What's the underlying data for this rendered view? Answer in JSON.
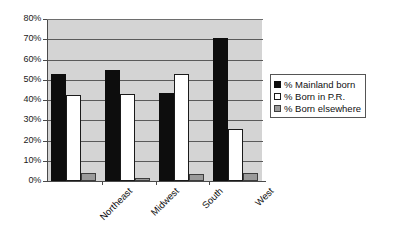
{
  "chart_data": {
    "type": "bar",
    "title": "",
    "subtitle": "",
    "xlabel": "",
    "ylabel": "",
    "categories": [
      "Northeast",
      "Midwest",
      "South",
      "West"
    ],
    "series": [
      {
        "name": "% Mainland born",
        "color": "#0d0d0d",
        "values": [
          53,
          55,
          43.5,
          70.5
        ]
      },
      {
        "name": "% Born in P.R.",
        "color": "#ffffff",
        "values": [
          42.5,
          43,
          53,
          25.5
        ]
      },
      {
        "name": "% Born elsewhere",
        "color": "#9a9a9a",
        "values": [
          4,
          1.5,
          3.5,
          4
        ]
      }
    ],
    "ylim": [
      0,
      80
    ],
    "ytick_step": 10,
    "ytick_labels": [
      "0%",
      "10%",
      "20%",
      "30%",
      "40%",
      "50%",
      "60%",
      "70%",
      "80%"
    ],
    "grid": true,
    "legend_position": "right",
    "plot_background": "#d4d4d4",
    "gridline_color": "#5a5a5a",
    "axis_color": "#4a4a4a"
  },
  "legend": {
    "entries": [
      "% Mainland born",
      "% Born in P.R.",
      "% Born elsewhere"
    ]
  }
}
